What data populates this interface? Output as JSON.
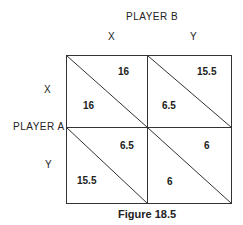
{
  "player_b": {
    "title": "PLAYER B",
    "strategies": [
      "X",
      "Y"
    ]
  },
  "player_a": {
    "title": "PLAYER A",
    "strategies": [
      "X",
      "Y"
    ]
  },
  "matrix": {
    "cells": [
      {
        "row": "X",
        "col": "X",
        "row_payoff": "16",
        "col_payoff": "16"
      },
      {
        "row": "X",
        "col": "Y",
        "row_payoff": "6.5",
        "col_payoff": "15.5"
      },
      {
        "row": "Y",
        "col": "X",
        "row_payoff": "15.5",
        "col_payoff": "6.5"
      },
      {
        "row": "Y",
        "col": "Y",
        "row_payoff": "6",
        "col_payoff": "6"
      }
    ]
  },
  "caption": "Figure 18.5",
  "colors": {
    "line": "#333333",
    "text": "#222222",
    "background": "#ffffff"
  }
}
